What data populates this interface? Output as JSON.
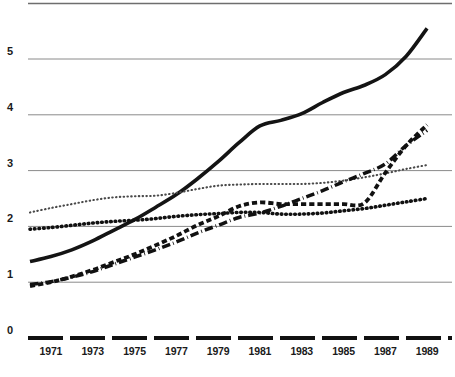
{
  "chart_data": {
    "type": "line",
    "title": "",
    "subtitle": "",
    "xlabel": "",
    "ylabel": "",
    "xlim": [
      1970,
      1990
    ],
    "ylim": [
      0,
      5.8
    ],
    "grid": true,
    "grid_axis": "y",
    "legend_position": "none",
    "x": [
      1970,
      1971,
      1972,
      1973,
      1974,
      1975,
      1976,
      1977,
      1978,
      1979,
      1980,
      1981,
      1982,
      1983,
      1984,
      1985,
      1986,
      1987,
      1988,
      1989
    ],
    "y_ticks": [
      "0",
      "1",
      "2",
      "3",
      "4",
      "5"
    ],
    "y_tick_values": [
      0,
      1,
      2,
      3,
      4,
      5
    ],
    "x_ticks": [
      "1971",
      "1973",
      "1975",
      "1977",
      "1979",
      "1981",
      "1983",
      "1985",
      "1987",
      "1989"
    ],
    "x_tick_values": [
      1971,
      1973,
      1975,
      1977,
      1979,
      1981,
      1983,
      1985,
      1987,
      1989
    ],
    "series": [
      {
        "name": "series-solid",
        "style": "solid",
        "color": "#141414",
        "width": 3.6,
        "values": [
          1.37,
          1.46,
          1.58,
          1.74,
          1.93,
          2.12,
          2.34,
          2.57,
          2.85,
          3.16,
          3.5,
          3.8,
          3.9,
          4.02,
          4.22,
          4.4,
          4.53,
          4.72,
          5.05,
          5.55
        ]
      },
      {
        "name": "series-dotted-light",
        "style": "fine-dotted",
        "color": "#4a4a4a",
        "width": 2.1,
        "values": [
          2.25,
          2.33,
          2.4,
          2.47,
          2.52,
          2.54,
          2.55,
          2.6,
          2.67,
          2.73,
          2.75,
          2.76,
          2.76,
          2.76,
          2.78,
          2.82,
          2.88,
          2.95,
          3.03,
          3.1
        ]
      },
      {
        "name": "series-dotted-bold",
        "style": "bold-dotted",
        "color": "#111111",
        "width": 3.6,
        "values": [
          1.95,
          1.98,
          2.02,
          2.06,
          2.09,
          2.11,
          2.14,
          2.18,
          2.21,
          2.23,
          2.25,
          2.25,
          2.22,
          2.22,
          2.24,
          2.28,
          2.32,
          2.38,
          2.44,
          2.5
        ]
      },
      {
        "name": "series-dashed",
        "style": "dashed",
        "color": "#111111",
        "width": 3.8,
        "values": [
          0.93,
          1.0,
          1.1,
          1.22,
          1.36,
          1.5,
          1.66,
          1.83,
          2.02,
          2.18,
          2.36,
          2.43,
          2.4,
          2.4,
          2.4,
          2.4,
          2.42,
          2.96,
          3.45,
          3.82
        ]
      },
      {
        "name": "series-dash-dot",
        "style": "dash-dot",
        "color": "#111111",
        "width": 3.5,
        "values": [
          0.96,
          1.01,
          1.09,
          1.19,
          1.32,
          1.45,
          1.58,
          1.72,
          1.88,
          2.02,
          2.16,
          2.24,
          2.36,
          2.5,
          2.64,
          2.8,
          2.95,
          3.12,
          3.45,
          3.72
        ]
      }
    ]
  },
  "axis": {
    "y_labels": [
      "5",
      "4",
      "3",
      "2",
      "1",
      "0"
    ],
    "x_labels": [
      "1971",
      "1973",
      "1975",
      "1977",
      "1979",
      "1981",
      "1983",
      "1985",
      "1987",
      "1989"
    ]
  }
}
